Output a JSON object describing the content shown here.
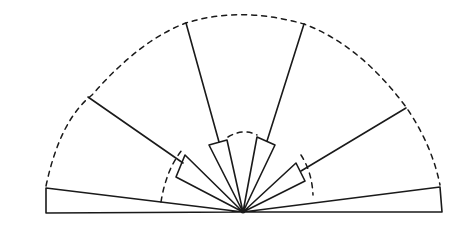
{
  "diagram": {
    "type": "fan-diagram",
    "colors": {
      "stroke": "#1a1a1a",
      "background": "#ffffff"
    },
    "center": [
      243,
      212
    ],
    "outer_arc": {
      "style": "dashed",
      "radius": 200
    },
    "inner_arc": {
      "style": "dashed",
      "radius": 80
    },
    "wedges": [
      {
        "id": "left-flat",
        "points": [
          [
            243,
            212
          ],
          [
            46,
            188
          ],
          [
            46,
            213
          ]
        ]
      },
      {
        "id": "left-mid",
        "points": [
          [
            243,
            212
          ],
          [
            176,
            157
          ],
          [
            190,
            137
          ]
        ],
        "ray_to": [
          88,
          97
        ]
      },
      {
        "id": "left-inner",
        "points": [
          [
            243,
            212
          ],
          [
            208,
            144
          ],
          [
            228,
            139
          ]
        ],
        "ray_to": [
          186,
          23
        ]
      },
      {
        "id": "right-inner",
        "points": [
          [
            243,
            212
          ],
          [
            257,
            136
          ],
          [
            275,
            145
          ]
        ],
        "ray_to": [
          304,
          24
        ]
      },
      {
        "id": "right-mid",
        "points": [
          [
            243,
            212
          ],
          [
            296,
            162
          ],
          [
            304,
            180
          ]
        ],
        "ray_to": [
          406,
          108
        ]
      },
      {
        "id": "right-flat",
        "points": [
          [
            243,
            212
          ],
          [
            440,
            187
          ],
          [
            442,
            212
          ]
        ]
      }
    ]
  }
}
